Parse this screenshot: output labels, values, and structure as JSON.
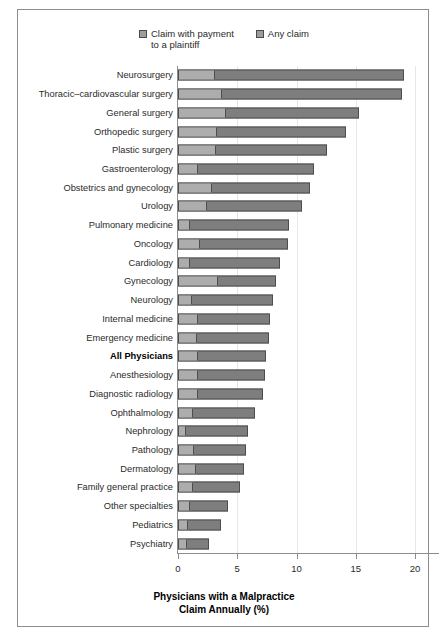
{
  "legend": {
    "items": [
      {
        "label": "Claim with payment\nto a plaintiff",
        "color": "#adadad",
        "name": "claim-with-payment"
      },
      {
        "label": "Any claim",
        "color": "#7e7e7e",
        "name": "any-claim"
      }
    ]
  },
  "chart_data": {
    "type": "bar",
    "orientation": "horizontal",
    "stacked": true,
    "title": "",
    "xlabel": "Physicians with a Malpractice\nClaim Annually (%)",
    "ylabel": "",
    "xlim": [
      0,
      20
    ],
    "xticks": [
      0,
      5,
      10,
      15,
      20
    ],
    "xticklabels": [
      "0",
      "5",
      "10",
      "15",
      "20"
    ],
    "grid": "vertical",
    "legend_position": "top-center",
    "categories": [
      "Neurosurgery",
      "Thoracic–cardiovascular surgery",
      "General surgery",
      "Orthopedic surgery",
      "Plastic surgery",
      "Gastroenterology",
      "Obstetrics and gynecology",
      "Urology",
      "Pulmonary medicine",
      "Oncology",
      "Cardiology",
      "Gynecology",
      "Neurology",
      "Internal medicine",
      "Emergency medicine",
      "All Physicians",
      "Anesthesiology",
      "Diagnostic radiology",
      "Ophthalmology",
      "Nephrology",
      "Pathology",
      "Dermatology",
      "Family general practice",
      "Other specialties",
      "Pediatrics",
      "Psychiatry"
    ],
    "highlight_category": "All Physicians",
    "series": [
      {
        "name": "Claim with payment to a plaintiff",
        "color": "#adadad",
        "values": [
          3.0,
          3.6,
          4.0,
          3.2,
          3.1,
          1.6,
          2.8,
          2.4,
          0.9,
          1.8,
          0.9,
          3.3,
          1.1,
          1.6,
          1.5,
          1.6,
          1.6,
          1.6,
          1.2,
          0.6,
          1.3,
          1.4,
          1.2,
          0.9,
          0.8,
          0.7
        ]
      },
      {
        "name": "Any claim",
        "color": "#7e7e7e",
        "values": [
          19.1,
          18.9,
          15.3,
          14.2,
          12.6,
          11.5,
          11.1,
          10.5,
          9.4,
          9.3,
          8.6,
          8.3,
          8.0,
          7.8,
          7.7,
          7.4,
          7.3,
          7.2,
          6.5,
          5.9,
          5.7,
          5.6,
          5.2,
          4.2,
          3.6,
          2.6
        ]
      }
    ]
  }
}
